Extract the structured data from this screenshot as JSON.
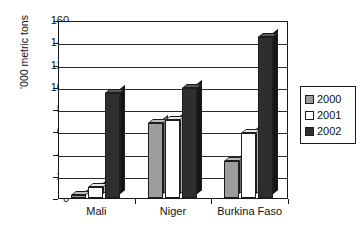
{
  "chart_data": {
    "type": "bar",
    "title": "",
    "subtitle": "",
    "xlabel": "",
    "ylabel": "'000 metric tons",
    "categories": [
      "Mali",
      "Niger",
      "Burkina Faso"
    ],
    "series": [
      {
        "name": "2000",
        "color": "#9d9d9d",
        "values": [
          3,
          67,
          33
        ]
      },
      {
        "name": "2001",
        "color": "#ffffff",
        "values": [
          10,
          70,
          58
        ]
      },
      {
        "name": "2002",
        "color": "#2e2e2e",
        "values": [
          94,
          99,
          145
        ]
      }
    ],
    "ylim": [
      0,
      160
    ],
    "ytick_step": 20,
    "yticks": [
      0,
      20,
      40,
      60,
      80,
      100,
      120,
      140,
      160
    ],
    "ytick_labels": [
      "0",
      "20",
      "40",
      "60",
      "80",
      "100",
      "120",
      "140",
      "160"
    ],
    "grid": true,
    "grid_axis": "y",
    "legend": true,
    "legend_position": "right",
    "legend_entries": [
      "2000",
      "2001",
      "2002"
    ],
    "bar_style": "3d",
    "plot_background": "#ffffff",
    "axis_color": "#1a1a1a"
  }
}
